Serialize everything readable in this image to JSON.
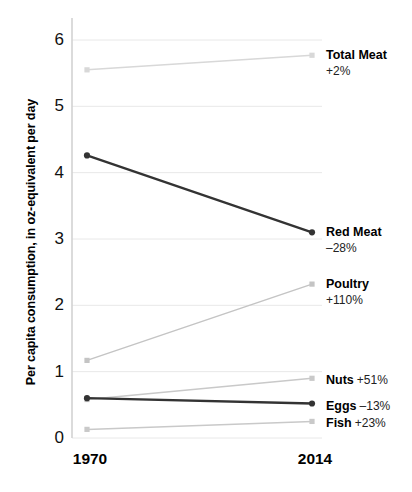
{
  "chart_data": {
    "type": "line",
    "title": "",
    "subtitle": "",
    "xlabel": "",
    "ylabel": "Per capita consumption, in oz-equivalent per day",
    "x": [
      "1970",
      "2014"
    ],
    "xtick_labels": [
      "1970",
      "2014"
    ],
    "ytick_labels": [
      "0",
      "1",
      "2",
      "3",
      "4",
      "5",
      "6"
    ],
    "ylim": [
      0,
      6
    ],
    "yticks": [
      0,
      1,
      2,
      3,
      4,
      5,
      6
    ],
    "grid": "horizontal",
    "legend": "right-inline-labels",
    "series": [
      {
        "name": "Total Meat",
        "annotation": "+2%",
        "values": [
          5.55,
          5.77
        ],
        "color": "#d8d8d8",
        "marker": "square",
        "label_layout": "stacked"
      },
      {
        "name": "Red Meat",
        "annotation": "–28%",
        "values": [
          4.26,
          3.1
        ],
        "color": "#333333",
        "marker": "circle",
        "label_layout": "stacked"
      },
      {
        "name": "Poultry",
        "annotation": "+110%",
        "values": [
          1.17,
          2.32
        ],
        "color": "#c4c4c4",
        "marker": "square",
        "label_layout": "stacked"
      },
      {
        "name": "Nuts",
        "annotation": "+51%",
        "values": [
          0.58,
          0.9
        ],
        "color": "#c9c9c9",
        "marker": "square",
        "label_layout": "inline"
      },
      {
        "name": "Eggs",
        "annotation": "–13%",
        "values": [
          0.6,
          0.52
        ],
        "color": "#333333",
        "marker": "circle",
        "label_layout": "inline"
      },
      {
        "name": "Fish",
        "annotation": "+23%",
        "values": [
          0.13,
          0.25
        ],
        "color": "#c9c9c9",
        "marker": "square",
        "label_layout": "inline"
      }
    ],
    "colors": {
      "grid": "#e8e8e8",
      "axis": "#d2d2d2",
      "text": "#111111",
      "dark_series": "#333333",
      "light_series": "#c9c9c9"
    }
  }
}
